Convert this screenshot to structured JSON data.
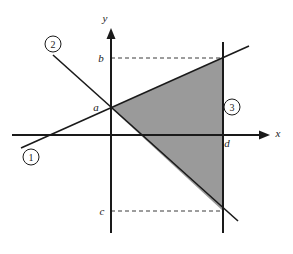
{
  "figure": {
    "background_color": "#ffffff",
    "stroke_color": "#1a1a1a",
    "shade_color": "#9a9a9a",
    "dashed_color": "#3a3a3a"
  },
  "axes": {
    "x_axis": {
      "label": "x",
      "label_x": 278,
      "label_y": 137,
      "y": 135,
      "x_start": 12,
      "x_end": 262,
      "arrow_tip_x": 270
    },
    "y_axis": {
      "label": "y",
      "label_x": 105,
      "label_y": 22,
      "x": 111,
      "y_start": 233,
      "y_end": 36,
      "arrow_tip_y": 28
    }
  },
  "lines": [
    {
      "id": "line-1",
      "callout": "1",
      "callout_cx": 31,
      "callout_cy": 157,
      "callout_r": 8,
      "x1": 21,
      "y1": 148,
      "x2": 249,
      "y2": 46,
      "description": "rising line through (0, a)"
    },
    {
      "id": "line-2",
      "callout": "2",
      "callout_cx": 53,
      "callout_cy": 44,
      "callout_r": 8,
      "x1": 53,
      "y1": 55,
      "x2": 238,
      "y2": 221,
      "description": "falling line through (0, a)"
    },
    {
      "id": "line-3",
      "callout": "3",
      "callout_cx": 232,
      "callout_cy": 107,
      "callout_r": 8,
      "x1": 223,
      "y1": 42,
      "x2": 223,
      "y2": 233,
      "description": "vertical line x = d"
    }
  ],
  "points": [
    {
      "id": "point-a",
      "label": "a",
      "label_x": 96,
      "label_y": 111,
      "x": 111,
      "y": 108,
      "description": "common y-intercept of line 1 and line 2"
    },
    {
      "id": "point-b",
      "label": "b",
      "label_x": 101,
      "label_y": 62,
      "x": 111,
      "y": 58,
      "description": "y value where line 1 meets x = d"
    },
    {
      "id": "point-c",
      "label": "c",
      "label_x": 102,
      "label_y": 215,
      "x": 111,
      "y": 211,
      "description": "y value where line 2 meets x = d"
    },
    {
      "id": "point-d",
      "label": "d",
      "label_x": 227,
      "label_y": 147,
      "x": 223,
      "y": 135,
      "description": "x value of the vertical line"
    }
  ],
  "guides": [
    {
      "id": "guide-b",
      "x1": 111,
      "y1": 58,
      "x2": 224,
      "y2": 58
    },
    {
      "id": "guide-c",
      "x1": 111,
      "y1": 211,
      "x2": 224,
      "y2": 211
    }
  ],
  "shaded_region": {
    "id": "shaded-triangle",
    "points": "111,108 223,58 223,211",
    "fill": "#9a9a9a",
    "description": "region bounded by line 1, line 2 and x = d"
  }
}
